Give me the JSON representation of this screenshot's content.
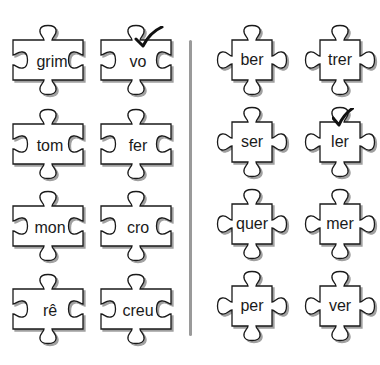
{
  "exercise": {
    "left_pieces": [
      {
        "label": "grim",
        "checked": false
      },
      {
        "label": "vo",
        "checked": true
      },
      {
        "label": "tom",
        "checked": false
      },
      {
        "label": "fer",
        "checked": false
      },
      {
        "label": "mon",
        "checked": false
      },
      {
        "label": "cro",
        "checked": false
      },
      {
        "label": "rê",
        "checked": false
      },
      {
        "label": "creu",
        "checked": false
      }
    ],
    "right_pieces": [
      {
        "label": "ber",
        "checked": false
      },
      {
        "label": "trer",
        "checked": false
      },
      {
        "label": "ser",
        "checked": false
      },
      {
        "label": "ler",
        "checked": true
      },
      {
        "label": "quer",
        "checked": false
      },
      {
        "label": "mer",
        "checked": false
      },
      {
        "label": "per",
        "checked": false
      },
      {
        "label": "ver",
        "checked": false
      }
    ],
    "icons": {
      "check": "checkmark-icon"
    },
    "colors": {
      "outline": "#1a1a1a",
      "shadow": "#a0a0a0",
      "divider": "#9a9a9a",
      "fill": "#ffffff"
    }
  }
}
